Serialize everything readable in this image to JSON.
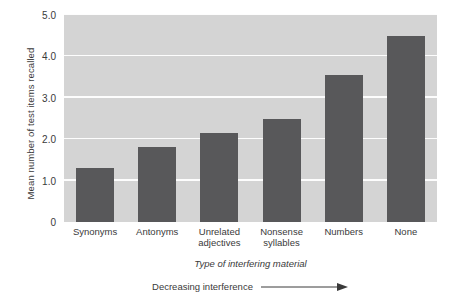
{
  "chart_data": {
    "type": "bar",
    "title": "",
    "categories": [
      "Synonyms",
      "Antonyms",
      "Unrelated adjectives",
      "Nonsense syllables",
      "Numbers",
      "None"
    ],
    "values": [
      1.3,
      1.8,
      2.15,
      2.5,
      3.55,
      4.5
    ],
    "xlabel": "Type of interfering material",
    "ylabel": "Mean number of test items recalled",
    "ylim": [
      0,
      5.0
    ],
    "yticks": [
      "0",
      "1.0",
      "2.0",
      "3.0",
      "4.0",
      "5.0"
    ],
    "ytick_values": [
      0,
      1.0,
      2.0,
      3.0,
      4.0,
      5.0
    ],
    "grid": true,
    "legend": "none",
    "annotation": "Decreasing interference",
    "annotation_arrow": "right-arrow",
    "bar_color": "#58585a",
    "plot_background": "#d4d4d4",
    "gridline_color": "#fdfdfd"
  },
  "x_label_lines": [
    [
      "Synonyms"
    ],
    [
      "Antonyms"
    ],
    [
      "Unrelated",
      "adjectives"
    ],
    [
      "Nonsense",
      "syllables"
    ],
    [
      "Numbers"
    ],
    [
      "None"
    ]
  ]
}
